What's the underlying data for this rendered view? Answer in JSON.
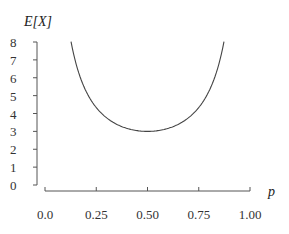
{
  "chart_data": {
    "type": "line",
    "title": "",
    "xlabel": "p",
    "ylabel": "E[X]",
    "xlim": [
      0,
      1
    ],
    "ylim": [
      0,
      8
    ],
    "grid": false,
    "legend": null,
    "x_ticks": [
      "0.0",
      "0.25",
      "0.50",
      "0.75",
      "1.00"
    ],
    "y_ticks": [
      "0",
      "1",
      "2",
      "3",
      "4",
      "5",
      "6",
      "7",
      "8"
    ],
    "series": [
      {
        "name": "E[X]",
        "formula": "1/(p(1-p)) - 1",
        "x": [
          0.127,
          0.15,
          0.175,
          0.2,
          0.25,
          0.3,
          0.35,
          0.4,
          0.45,
          0.5,
          0.55,
          0.6,
          0.65,
          0.7,
          0.75,
          0.8,
          0.825,
          0.85,
          0.873
        ],
        "values": [
          8.02,
          6.84,
          5.93,
          5.25,
          4.33,
          3.76,
          3.4,
          3.17,
          3.04,
          3.0,
          3.04,
          3.17,
          3.4,
          3.76,
          4.33,
          5.25,
          5.93,
          6.84,
          8.02
        ]
      }
    ],
    "minimum": {
      "p": 0.5,
      "value": 3
    }
  },
  "axes": {
    "x_title": "p",
    "y_title": "E[X]"
  }
}
